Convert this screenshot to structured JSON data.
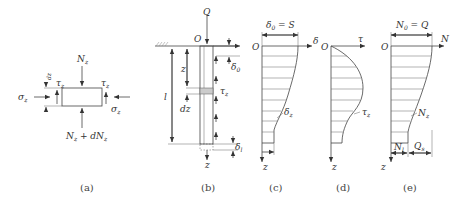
{
  "figure": {
    "panels": [
      {
        "id": "a",
        "caption": "(a)",
        "labels": {
          "top_force": "N",
          "top_force_sub": "z",
          "bottom_force": "N",
          "bottom_force_sub": "z",
          "bottom_force_suffix": " + d",
          "bottom_force_N2": "N",
          "bottom_force_N2_sub": "z",
          "shear_left": "τ",
          "shear_left_sub": "z",
          "shear_right": "τ",
          "shear_right_sub": "z",
          "normal_left": "σ",
          "normal_left_sub": "z",
          "normal_right": "σ",
          "normal_right_sub": "z",
          "height": "dz"
        }
      },
      {
        "id": "b",
        "caption": "(b)",
        "labels": {
          "load": "Q",
          "origin": "O",
          "depth": "z",
          "element": "dz",
          "length": "l",
          "shear": "τ",
          "shear_sub": "z",
          "top_disp": "δ",
          "top_disp_sub": "0",
          "tip_disp": "δ",
          "tip_disp_sub": "l",
          "axis": "z"
        }
      },
      {
        "id": "c",
        "caption": "(c)",
        "labels": {
          "top_value": "δ",
          "top_value_sub": "0",
          "top_value_eq": " = S",
          "origin": "O",
          "axis_x": "δ",
          "axis_z": "z",
          "curve": "δ",
          "curve_sub": "z"
        }
      },
      {
        "id": "d",
        "caption": "(d)",
        "labels": {
          "origin": "O",
          "axis_x": "τ",
          "axis_z": "z",
          "curve": "τ",
          "curve_sub": "z"
        }
      },
      {
        "id": "e",
        "caption": "(e)",
        "labels": {
          "top_value": "N",
          "top_value_sub": "0",
          "top_value_eq": " = Q",
          "origin": "O",
          "axis_x": "N",
          "axis_z": "z",
          "curve": "N",
          "curve_sub": "z",
          "tip_force": "N",
          "tip_force_sub": "l",
          "side_friction": "Q",
          "side_friction_sub": "s"
        }
      }
    ]
  }
}
